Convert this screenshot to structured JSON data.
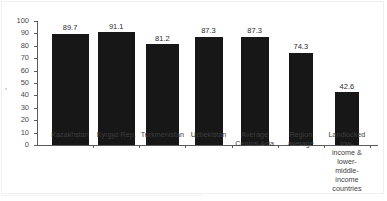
{
  "chart_data": {
    "type": "bar",
    "title": "",
    "subtitle": "",
    "xlabel": "",
    "ylabel": "",
    "ylim": [
      0,
      100
    ],
    "yticks": [
      0,
      10,
      20,
      30,
      40,
      50,
      60,
      70,
      80,
      90,
      100
    ],
    "grid": false,
    "legend": null,
    "bar_color": "#171717",
    "categories": [
      "Kazakhstan",
      "Kyrgyz Rep.",
      "Turkmenistan",
      "Uzbekistan",
      "Average Central Asia",
      "Region average",
      "Landlocked low-income & lower-middle-income countries"
    ],
    "category_lines": [
      [
        "Kazakhstan"
      ],
      [
        "Kyrgyz Rep."
      ],
      [
        "Turkmenistan"
      ],
      [
        "Uzbekistan"
      ],
      [
        "Average",
        "Central Asia"
      ],
      [
        "Region",
        "average"
      ],
      [
        "Landlocked low-",
        "income & lower-",
        "middle-income",
        "countries"
      ]
    ],
    "values": [
      89.7,
      91.1,
      81.2,
      87.3,
      87.3,
      74.3,
      42.6
    ],
    "value_labels": [
      "89.7",
      "91.1",
      "81.2",
      "87.3",
      "87.3",
      "74.3",
      "42.6"
    ]
  }
}
